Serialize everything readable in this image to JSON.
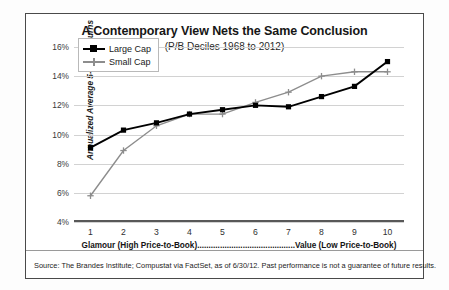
{
  "chart_data": {
    "type": "line",
    "title": "A Contemporary View Nets the Same Conclusion",
    "subtitle": "(P/B Deciles 1968 to 2012)",
    "xlabel": "Glamour (High Price-to-Book)...........................................Value (Low Price-to-Book)",
    "ylabel": "Annualized Average 5-Year Returns",
    "categories": [
      "1",
      "2",
      "3",
      "4",
      "5",
      "6",
      "7",
      "8",
      "9",
      "10"
    ],
    "ylim": [
      4,
      16
    ],
    "yticks": [
      "4%",
      "6%",
      "8%",
      "10%",
      "12%",
      "14%",
      "16%"
    ],
    "ytick_values": [
      4,
      6,
      8,
      10,
      12,
      14,
      16
    ],
    "grid": true,
    "legend_position": "upper-left",
    "series": [
      {
        "name": "Large Cap",
        "color": "#000000",
        "marker": "square",
        "values": [
          9.1,
          10.3,
          10.8,
          11.4,
          11.7,
          12.0,
          11.9,
          12.6,
          13.3,
          15.0
        ]
      },
      {
        "name": "Small Cap",
        "color": "#8d8d8d",
        "marker": "plus",
        "values": [
          5.8,
          8.9,
          10.6,
          11.4,
          11.4,
          12.2,
          12.9,
          14.0,
          14.3,
          14.3
        ]
      }
    ]
  },
  "legend": {
    "items": [
      {
        "label": "Large Cap"
      },
      {
        "label": "Small Cap"
      }
    ]
  },
  "footer": {
    "source": "Source: The Brandes Institute; Compustat via FactSet, as of 6/30/12. Past performance is not a guarantee of future results."
  }
}
